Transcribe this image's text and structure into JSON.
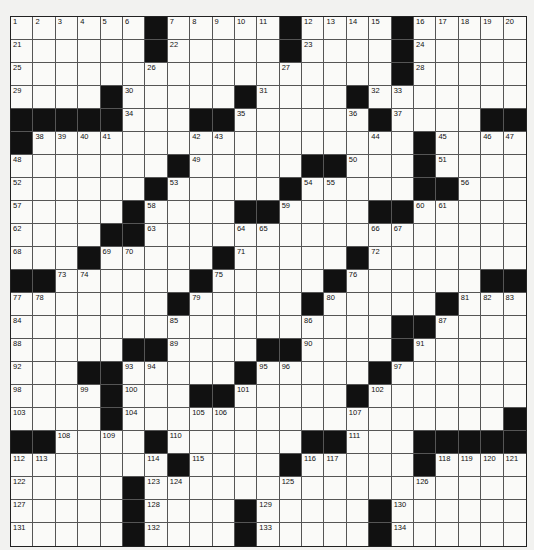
{
  "puzzle": {
    "rows": 23,
    "cols": 23,
    "colors": {
      "black": "#111111",
      "white": "#fafaf8",
      "lines": "#555555"
    },
    "grid": [
      [
        "1",
        "2",
        "3",
        "4",
        "5",
        "6",
        "#",
        "7",
        "8",
        "9",
        "10",
        "11",
        "#",
        "12",
        "13",
        "14",
        "15",
        "#",
        "16",
        "17",
        "18",
        "19",
        "20"
      ],
      [
        "21",
        "",
        "",
        "",
        "",
        "",
        "#",
        "22",
        "",
        "",
        "",
        "",
        "#",
        "23",
        "",
        "",
        "",
        "#",
        "24",
        "",
        "",
        "",
        ""
      ],
      [
        "25",
        "",
        "",
        "",
        "",
        "",
        "26",
        "",
        "",
        "",
        "",
        "",
        "27",
        "",
        "",
        "",
        "",
        "#",
        "28",
        "",
        "",
        "",
        ""
      ],
      [
        "29",
        "",
        "",
        "",
        "#",
        "30",
        "",
        "",
        "",
        "",
        "#",
        "31",
        "",
        "",
        "",
        "#",
        "32",
        "33",
        "",
        "",
        "",
        "",
        ""
      ],
      [
        "#",
        "#",
        "#",
        "#",
        "#",
        "34",
        "",
        "",
        "#",
        "#",
        "35",
        "",
        "",
        "",
        "",
        "36",
        "#",
        "37",
        "",
        "",
        "",
        "#",
        "#"
      ],
      [
        "#",
        "38",
        "39",
        "40",
        "41",
        "",
        "",
        "",
        "42",
        "43",
        "",
        "",
        "",
        "",
        "",
        "",
        "44",
        "",
        "#",
        "45",
        "",
        "46",
        "47"
      ],
      [
        "48",
        "",
        "",
        "",
        "",
        "",
        "",
        "#",
        "49",
        "",
        "",
        "",
        "",
        "#",
        "#",
        "50",
        "",
        "",
        "#",
        "51",
        "",
        "",
        ""
      ],
      [
        "52",
        "",
        "",
        "",
        "",
        "",
        "#",
        "53",
        "",
        "",
        "",
        "",
        "#",
        "54",
        "55",
        "",
        "",
        "",
        "#",
        "#",
        "56",
        "",
        ""
      ],
      [
        "57",
        "",
        "",
        "",
        "",
        "#",
        "58",
        "",
        "",
        "",
        "#",
        "#",
        "59",
        "",
        "",
        "",
        "#",
        "#",
        "60",
        "61",
        "",
        "",
        ""
      ],
      [
        "62",
        "",
        "",
        "",
        "#",
        "#",
        "63",
        "",
        "",
        "",
        "64",
        "65",
        "",
        "",
        "",
        "",
        "66",
        "67",
        "",
        "",
        "",
        "",
        ""
      ],
      [
        "68",
        "",
        "",
        "#",
        "69",
        "70",
        "",
        "",
        "",
        "#",
        "71",
        "",
        "",
        "",
        "",
        "#",
        "72",
        "",
        "",
        "",
        "",
        "",
        ""
      ],
      [
        "#",
        "#",
        "73",
        "74",
        "",
        "",
        "",
        "",
        "#",
        "75",
        "",
        "",
        "",
        "",
        "#",
        "76",
        "",
        "",
        "",
        "",
        "",
        "#",
        "#"
      ],
      [
        "77",
        "78",
        "",
        "",
        "",
        "",
        "",
        "#",
        "79",
        "",
        "",
        "",
        "",
        "#",
        "80",
        "",
        "",
        "",
        "",
        "#",
        "81",
        "82",
        "83"
      ],
      [
        "84",
        "",
        "",
        "",
        "",
        "",
        "",
        "85",
        "",
        "",
        "",
        "",
        "",
        "86",
        "",
        "",
        "",
        "#",
        "#",
        "87",
        "",
        "",
        ""
      ],
      [
        "88",
        "",
        "",
        "",
        "",
        "#",
        "#",
        "89",
        "",
        "",
        "",
        "#",
        "#",
        "90",
        "",
        "",
        "",
        "#",
        "91",
        "",
        "",
        "",
        ""
      ],
      [
        "92",
        "",
        "",
        "#",
        "#",
        "93",
        "94",
        "",
        "",
        "",
        "#",
        "95",
        "96",
        "",
        "",
        "",
        "#",
        "97",
        "",
        "",
        "",
        "",
        ""
      ],
      [
        "98",
        "",
        "",
        "99",
        "#",
        "100",
        "",
        "",
        "#",
        "#",
        "101",
        "",
        "",
        "",
        "",
        "#",
        "102",
        "",
        "",
        "",
        "",
        "",
        ""
      ],
      [
        "103",
        "",
        "",
        "",
        "#",
        "104",
        "",
        "",
        "105",
        "106",
        "",
        "",
        "",
        "",
        "",
        "107",
        "",
        "",
        "",
        "",
        "",
        "",
        "#"
      ],
      [
        "#",
        "#",
        "108",
        "",
        "109",
        "",
        "#",
        "110",
        "",
        "",
        "",
        "",
        "",
        "#",
        "#",
        "111",
        "",
        "",
        "#",
        "#",
        "#",
        "#",
        "#"
      ],
      [
        "112",
        "113",
        "",
        "",
        "",
        "",
        "114",
        "#",
        "115",
        "",
        "",
        "",
        "#",
        "116",
        "117",
        "",
        "",
        "",
        "#",
        "118",
        "119",
        "120",
        "121"
      ],
      [
        "122",
        "",
        "",
        "",
        "",
        "#",
        "123",
        "124",
        "",
        "",
        "",
        "",
        "125",
        "",
        "",
        "",
        "",
        "",
        "126",
        "",
        "",
        "",
        ""
      ],
      [
        "127",
        "",
        "",
        "",
        "",
        "#",
        "128",
        "",
        "",
        "",
        "#",
        "129",
        "",
        "",
        "",
        "",
        "#",
        "130",
        "",
        "",
        "",
        "",
        ""
      ],
      [
        "131",
        "",
        "",
        "",
        "",
        "#",
        "132",
        "",
        "",
        "",
        "#",
        "133",
        "",
        "",
        "",
        "",
        "#",
        "134",
        "",
        "",
        "",
        "",
        ""
      ]
    ]
  }
}
